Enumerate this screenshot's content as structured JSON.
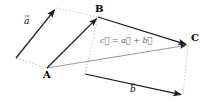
{
  "figure": {
    "background_color": "#ffffff",
    "dark_stroke": "#1a1a1a",
    "grey_stroke": "#8c8c8c",
    "dotted_stroke": "#b0b0b0",
    "width": 210,
    "height": 107
  },
  "points": {
    "A": {
      "label": "A",
      "x": 47,
      "y": 68,
      "label_x": 43,
      "label_y": 71
    },
    "B": {
      "label": "B",
      "x": 98,
      "y": 17,
      "label_x": 95,
      "label_y": 4
    },
    "C": {
      "label": "C",
      "x": 188,
      "y": 45,
      "label_x": 191,
      "label_y": 33
    },
    "a_tip": {
      "x": 56,
      "y": 8
    },
    "a_tail": {
      "x": 16,
      "y": 58
    },
    "b_tail": {
      "x": 85,
      "y": 74
    },
    "b_tip": {
      "x": 183,
      "y": 95
    }
  },
  "labels": {
    "vector_a": "a⃗",
    "vector_a_plain": "a",
    "vector_b": "b⃗",
    "vector_b_plain": "b",
    "vector_c_equation": "c⃗ = a⃗ + b⃗",
    "point_a": "A",
    "point_b": "B",
    "point_c": "C"
  },
  "label_positions": {
    "vector_a": {
      "x": 24,
      "y": 18
    },
    "vector_b": {
      "x": 129,
      "y": 86
    },
    "equation": {
      "x": 100,
      "y": 36
    }
  },
  "arrows": [
    {
      "name": "vector-a-free",
      "from": [
        16,
        58
      ],
      "to": [
        56,
        8
      ],
      "style": "solid-dark",
      "label": "a⃗"
    },
    {
      "name": "vector-a-at-A",
      "from": [
        47,
        68
      ],
      "to": [
        98,
        17
      ],
      "style": "solid-dark",
      "label": ""
    },
    {
      "name": "vector-b-free",
      "from": [
        85,
        74
      ],
      "to": [
        183,
        95
      ],
      "style": "solid-dark",
      "label": "b⃗"
    },
    {
      "name": "vector-b-at-B",
      "from": [
        98,
        17
      ],
      "to": [
        188,
        45
      ],
      "style": "solid-dark",
      "label": ""
    },
    {
      "name": "vector-c-resultant",
      "from": [
        47,
        68
      ],
      "to": [
        188,
        45
      ],
      "style": "solid-grey",
      "label": "c⃗ = a⃗ + b⃗"
    }
  ],
  "dotted_lines": [
    {
      "name": "a-tail-to-A",
      "from": [
        16,
        58
      ],
      "to": [
        47,
        68
      ]
    },
    {
      "name": "a-tip-to-B",
      "from": [
        56,
        8
      ],
      "to": [
        98,
        17
      ]
    },
    {
      "name": "B-to-b-tail",
      "from": [
        98,
        17
      ],
      "to": [
        85,
        74
      ]
    },
    {
      "name": "C-to-b-tip",
      "from": [
        188,
        45
      ],
      "to": [
        183,
        95
      ]
    }
  ]
}
